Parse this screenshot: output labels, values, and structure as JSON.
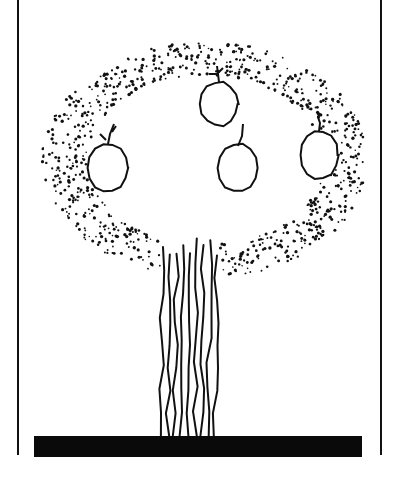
{
  "illustration": {
    "subject": "tree",
    "colors": {
      "ink": "#111111",
      "paper": "#ffffff",
      "ground": "#0a0a0a"
    },
    "frame": {
      "left_x": 18,
      "right_x": 381,
      "top_y": 0,
      "bottom_y": 455
    },
    "ground": {
      "x": 34,
      "y": 436,
      "width": 328,
      "height": 21
    },
    "canopy": {
      "cx": 205,
      "cy": 160,
      "rx": 163,
      "ry": 118,
      "style": "stippled"
    },
    "apples": [
      {
        "cx": 108,
        "cy": 168,
        "rx": 20,
        "ry": 24,
        "stem": "leafy"
      },
      {
        "cx": 219,
        "cy": 104,
        "rx": 19,
        "ry": 22,
        "stem": "bow"
      },
      {
        "cx": 238,
        "cy": 168,
        "rx": 20,
        "ry": 24,
        "stem": "thin"
      },
      {
        "cx": 319,
        "cy": 155,
        "rx": 19,
        "ry": 24,
        "stem": "knot"
      }
    ],
    "trunk": {
      "x_left": 163,
      "x_right": 217,
      "top_y": 238,
      "bottom_y": 436,
      "strokes": 9
    }
  }
}
